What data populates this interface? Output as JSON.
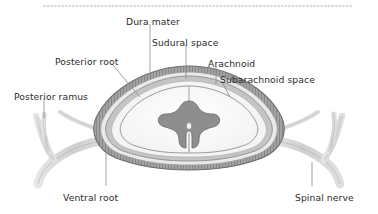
{
  "figure": {
    "background_color": "#ffffff",
    "text_color": "#2b2b2b",
    "leader_line_color": "#8a8a8a",
    "dotted_border_color": "#cfc8bf",
    "palette": {
      "dura_mater": "#9a9a9a",
      "dura_hatch": "#6f6f6f",
      "arachnoid": "#bdbdbd",
      "subarachnoid_space": "#f2f2f2",
      "white_matter": "#fbfbfb",
      "gray_matter": "#8e8e8e",
      "nerve": "#d5d5d5",
      "nerve_outline": "#a8a8a8",
      "outline": "#7d7d7d"
    },
    "labels": [
      {
        "id": "dura-mater",
        "text": "Dura mater",
        "x": 126,
        "y": 17,
        "anchor": "start"
      },
      {
        "id": "sudural-space",
        "text": "Sudural space",
        "x": 152,
        "y": 38,
        "anchor": "start"
      },
      {
        "id": "arachnoid",
        "text": "Arachnoid",
        "x": 208,
        "y": 59,
        "anchor": "start"
      },
      {
        "id": "subarachnoid-space",
        "text": "Subarachnoid space",
        "x": 220,
        "y": 75,
        "anchor": "start"
      },
      {
        "id": "posterior-root",
        "text": "Posterior root",
        "x": 55,
        "y": 57,
        "anchor": "start"
      },
      {
        "id": "posterior-ramus",
        "text": "Posterior ramus",
        "x": 14,
        "y": 92,
        "anchor": "start"
      },
      {
        "id": "ventral-root",
        "text": "Ventral root",
        "x": 63,
        "y": 193,
        "anchor": "start"
      },
      {
        "id": "spinal-nerve",
        "text": "Spinal nerve",
        "x": 295,
        "y": 193,
        "anchor": "start"
      }
    ],
    "structures": [
      {
        "id": "dura-mater",
        "name": "Dura mater"
      },
      {
        "id": "sudural-space",
        "name": "Sudural space"
      },
      {
        "id": "arachnoid",
        "name": "Arachnoid"
      },
      {
        "id": "subarachnoid-space",
        "name": "Subarachnoid space"
      },
      {
        "id": "white-matter",
        "name": "White matter"
      },
      {
        "id": "gray-matter",
        "name": "Gray matter"
      },
      {
        "id": "posterior-root",
        "name": "Posterior root"
      },
      {
        "id": "ventral-root",
        "name": "Ventral root"
      },
      {
        "id": "posterior-ramus",
        "name": "Posterior ramus"
      },
      {
        "id": "spinal-nerve",
        "name": "Spinal nerve"
      }
    ]
  }
}
